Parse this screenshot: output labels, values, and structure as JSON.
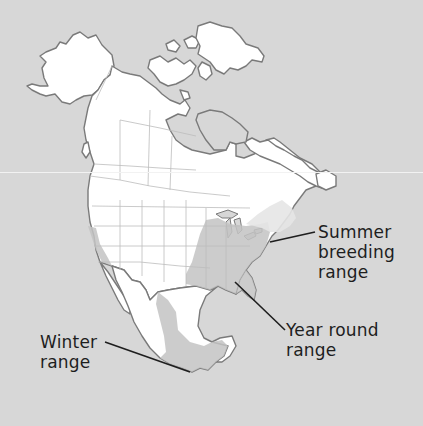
{
  "map": {
    "subject": "North America species range map",
    "colors": {
      "background": "#d7d7d7",
      "land": "#ffffff",
      "water_inland": "#d7d7d7",
      "coastline": "#7a7a7a",
      "borders": "#bdbdbd",
      "range_fill": "#c8c8c8",
      "leader_line": "#1e1e1e"
    },
    "legend_labels": [
      {
        "id": "summer",
        "lines": [
          "Summer",
          "breeding",
          "range"
        ]
      },
      {
        "id": "yearround",
        "lines": [
          "Year round",
          "range"
        ]
      },
      {
        "id": "winter",
        "lines": [
          "Winter",
          "range"
        ]
      }
    ]
  }
}
